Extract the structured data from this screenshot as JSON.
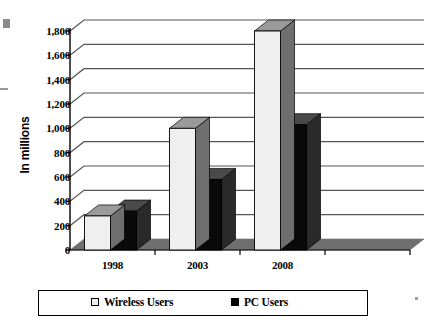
{
  "chart_data": {
    "type": "bar",
    "title": "",
    "subtitle": "",
    "xlabel": "",
    "ylabel": "In millions",
    "categories": [
      "1998",
      "2003",
      "2008"
    ],
    "series": [
      {
        "name": "Wireless Users",
        "values": [
          280,
          1000,
          1800
        ],
        "color": "#efefef"
      },
      {
        "name": "PC Users",
        "values": [
          320,
          580,
          1030
        ],
        "color": "#000000"
      }
    ],
    "ylim": [
      0,
      1800
    ],
    "ytick_step": 200,
    "ytick_labels": [
      "1,800",
      "1,600",
      "1,400",
      "1,200",
      "1,000",
      "800",
      "600",
      "400",
      "200",
      "0"
    ],
    "ytick_values": [
      1800,
      1600,
      1400,
      1200,
      1000,
      800,
      600,
      400,
      200,
      0
    ],
    "grid": true,
    "grid_axis": "y",
    "legend_position": "bottom",
    "style_3d": true,
    "empty_trailing_category": true
  },
  "legend": {
    "entries": [
      {
        "marker": "open-square",
        "label": "Wireless Users"
      },
      {
        "marker": "filled-square",
        "label": "PC Users"
      }
    ]
  },
  "colors": {
    "wireless_face": "#efefef",
    "wireless_top": "#9a9a9a",
    "wireless_side": "#6e6e6e",
    "pc_face": "#0a0a0a",
    "pc_top": "#4a4a4a",
    "pc_side": "#2a2a2a",
    "grid": "#555555",
    "axis": "#000000",
    "floor": "#6f6f6f",
    "background": "#ffffff"
  }
}
